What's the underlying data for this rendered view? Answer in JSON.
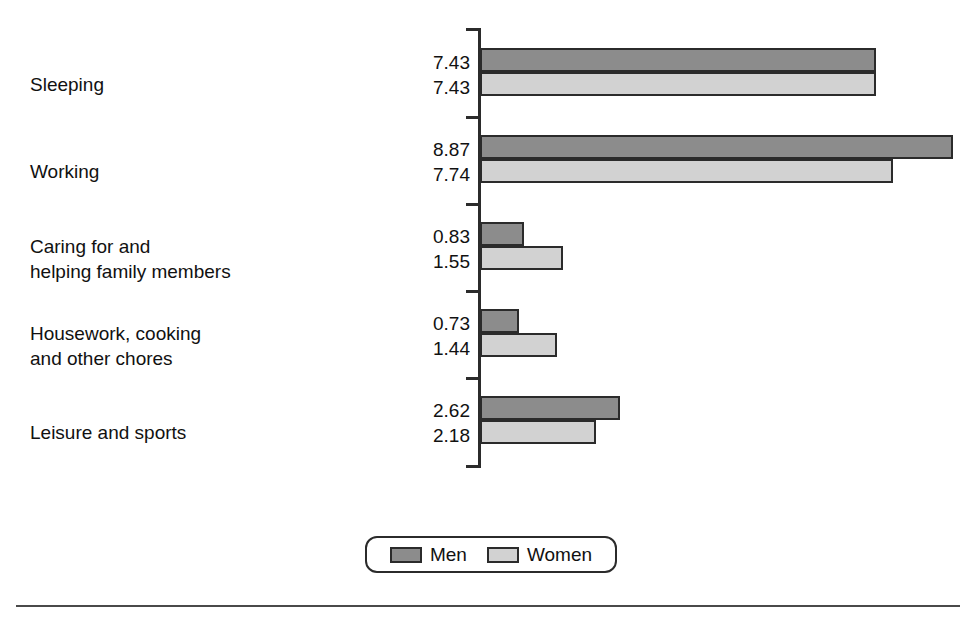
{
  "chart_data": {
    "type": "bar",
    "orientation": "horizontal",
    "title": "",
    "subtitle": "",
    "xlabel": "",
    "ylabel": "",
    "grid": false,
    "legend_position": "bottom-center",
    "axis_range_hours": [
      0,
      9.3
    ],
    "categories": [
      "Sleeping",
      "Working",
      "Caring for and\nhelping family members",
      "Housework, cooking\nand other chores",
      "Leisure and sports"
    ],
    "series": [
      {
        "name": "Men",
        "color": "#8c8c8c",
        "values": [
          7.43,
          8.87,
          0.83,
          0.73,
          2.62
        ],
        "value_labels": [
          "7.43",
          "8.87",
          "0.83",
          "0.73",
          "2.62"
        ]
      },
      {
        "name": "Women",
        "color": "#d2d2d2",
        "values": [
          7.43,
          7.74,
          1.55,
          1.44,
          2.18
        ],
        "value_labels": [
          "7.43",
          "7.74",
          "1.55",
          "1.44",
          "2.18"
        ]
      }
    ]
  },
  "legend": {
    "items": [
      {
        "label": "Men",
        "color": "#8c8c8c"
      },
      {
        "label": "Women",
        "color": "#d2d2d2"
      }
    ]
  },
  "style": {
    "bar_outline": "#2b2b2b",
    "axis_color": "#2b2b2b",
    "rule_color": "#4a4a4a",
    "background": "#ffffff"
  }
}
